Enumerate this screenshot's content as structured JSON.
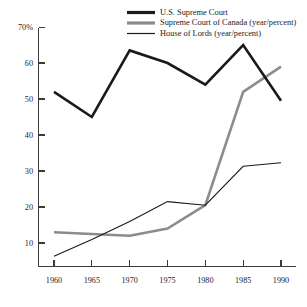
{
  "chart_data": {
    "type": "line",
    "title": "",
    "subtitle": "",
    "xlabel": "",
    "ylabel": "",
    "x": [
      1960,
      1965,
      1970,
      1975,
      1980,
      1985,
      1990
    ],
    "xticklabels": [
      "1960",
      "1965",
      "1970",
      "1975",
      "1980",
      "1985",
      "1990"
    ],
    "yticklabels": [
      "70%",
      "60",
      "50",
      "40",
      "30",
      "20",
      "10"
    ],
    "yticks": [
      70,
      60,
      50,
      40,
      30,
      20,
      10
    ],
    "xlim": [
      1958,
      1992
    ],
    "ylim": [
      3,
      70
    ],
    "grid": false,
    "legend_position": "top-right",
    "series": [
      {
        "name": "U.S. Supreme Court",
        "color": "#1a1a1a",
        "width": 2.6,
        "values": [
          52,
          45,
          63.5,
          60,
          54,
          65,
          49.5
        ]
      },
      {
        "name": "Supreme Court of Canada (year/percent)",
        "color": "#8c8c8c",
        "width": 2.6,
        "values": [
          13,
          12.5,
          12,
          14,
          20.5,
          52,
          59
        ]
      },
      {
        "name": "House of Lords (year/percent)",
        "color": "#1a1a1a",
        "width": 1.1,
        "values": [
          6.3,
          11,
          16,
          21.5,
          20.5,
          31.3,
          32.3
        ]
      }
    ]
  },
  "legend": {
    "items": [
      {
        "label": "U.S. Supreme Court",
        "color": "#1a1a1a",
        "width": 3.2
      },
      {
        "label": "Supreme Court of Canada (year/percent)",
        "color": "#8c8c8c",
        "width": 3.2
      },
      {
        "label": "House of Lords (year/percent)",
        "color": "#1a1a1a",
        "width": 1.2
      }
    ]
  },
  "artifacts": {
    "top_fragment_left": "",
    "top_fragment_right": ""
  }
}
